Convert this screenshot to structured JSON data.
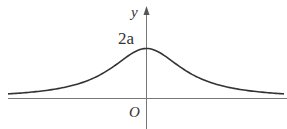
{
  "diagram": {
    "axes": {
      "y_label": "y",
      "origin_label": "O"
    },
    "annotations": {
      "peak_label": "2a"
    },
    "colors": {
      "curve": "#333333",
      "axis": "#666666"
    }
  }
}
